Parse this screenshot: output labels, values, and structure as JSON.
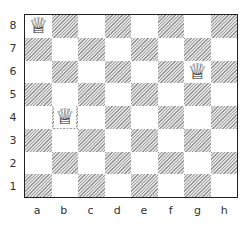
{
  "board": {
    "files": [
      "a",
      "b",
      "c",
      "d",
      "e",
      "f",
      "g",
      "h"
    ],
    "ranks": [
      "8",
      "7",
      "6",
      "5",
      "4",
      "3",
      "2",
      "1"
    ],
    "pieces": [
      {
        "square": "a8",
        "type": "queen",
        "color": "white",
        "glyph": "♕"
      },
      {
        "square": "g6",
        "type": "queen",
        "color": "white",
        "glyph": "♕"
      },
      {
        "square": "b4",
        "type": "queen",
        "color": "white",
        "glyph": "♕"
      }
    ],
    "colors": {
      "light": "#ffffff",
      "dark_hatch": "#9a9a9a",
      "border": "#222222"
    }
  }
}
